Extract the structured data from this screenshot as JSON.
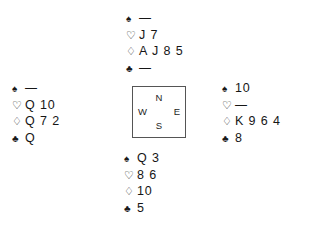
{
  "diagram": {
    "type": "bridge-deal-diagram",
    "background_color": "#ffffff",
    "text_color": "#161616"
  },
  "suits": {
    "spade": {
      "name": "spade-suit-symbol",
      "glyph": "♠"
    },
    "heart": {
      "name": "heart-suit-symbol",
      "glyph": "♡"
    },
    "diamond": {
      "name": "diamond-suit-symbol",
      "glyph": "♢"
    },
    "club": {
      "name": "club-suit-symbol",
      "glyph": "♣"
    }
  },
  "compass": {
    "north_label": "N",
    "south_label": "S",
    "west_label": "W",
    "east_label": "E",
    "border_color": "#555555"
  },
  "hands": {
    "north": {
      "position": "North",
      "spades": "—",
      "hearts": "J 7",
      "diamonds": "A J 8 5",
      "clubs": "—"
    },
    "west": {
      "position": "West",
      "spades": "—",
      "hearts": "Q 10",
      "diamonds": "Q 7 2",
      "clubs": "Q"
    },
    "east": {
      "position": "East",
      "spades": "10",
      "hearts": "—",
      "diamonds": "K 9 6 4",
      "clubs": "8"
    },
    "south": {
      "position": "South",
      "spades": "Q 3",
      "hearts": "8 6",
      "diamonds": "10",
      "clubs": "5"
    }
  }
}
